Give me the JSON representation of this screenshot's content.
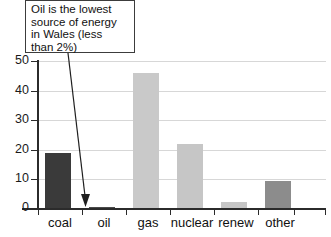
{
  "chart_data": {
    "type": "bar",
    "title": "",
    "xlabel": "",
    "ylabel": "",
    "categories": [
      "coal",
      "oil",
      "gas",
      "nuclear",
      "renew",
      "other"
    ],
    "values": [
      19,
      0.5,
      46,
      22,
      2.5,
      9.5
    ],
    "series": [
      {
        "name": "Energy source share in Wales",
        "values": [
          19,
          0.5,
          46,
          22,
          2.5,
          9.5
        ]
      }
    ],
    "bar_colors": [
      "#3a3a3a",
      "#4a4a4a",
      "#c9c9c9",
      "#c6c6c6",
      "#c6c6c6",
      "#8c8c8c"
    ],
    "ylim": [
      0,
      50
    ],
    "ytick_values": [
      0,
      10,
      20,
      30,
      40,
      50
    ],
    "ytick_labels": [
      "0",
      "10",
      "20",
      "30",
      "40",
      "50"
    ],
    "grid": true,
    "legend": false,
    "legend_position": "none",
    "annotations": [
      {
        "text": "Oil is the lowest source of energy in Wales (less than 2%)",
        "target_category": "oil",
        "style": "boxed-callout-with-arrow"
      }
    ]
  },
  "annotation": {
    "line1": "Oil is the lowest",
    "line2": "source of energy",
    "line3": "in Wales (less",
    "line4": "than 2%)"
  },
  "axis": {
    "y_labels": [
      "50",
      "40",
      "30",
      "20",
      "10",
      "0"
    ]
  },
  "x_labels": [
    "coal",
    "oil",
    "gas",
    "nuclear",
    "renew",
    "other"
  ],
  "colors": {
    "axis": "#2b2b2b",
    "grid": "#d7d7d7",
    "text": "#111111",
    "callout_border": "#3c3c3c",
    "leader": "#1f1f1f"
  }
}
